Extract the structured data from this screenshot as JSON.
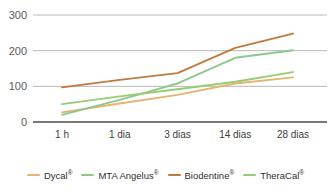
{
  "chart_data": {
    "type": "line",
    "title": "",
    "xlabel": "",
    "ylabel": "",
    "categories": [
      "1 h",
      "1 dia",
      "3 dias",
      "14 dias",
      "28 dias"
    ],
    "ylim": [
      0,
      300
    ],
    "yticks": [
      0,
      100,
      200,
      300
    ],
    "ytick_labels": [
      "0",
      "100",
      "200",
      "300"
    ],
    "grid": true,
    "legend_position": "bottom",
    "series": [
      {
        "name": "Dycal®",
        "base_name": "Dycal",
        "registered": "®",
        "color": "#e8b273",
        "values": [
          27,
          52,
          76,
          108,
          125
        ]
      },
      {
        "name": "MTA Angelus®",
        "base_name": "MTA Angelus",
        "registered": "®",
        "color": "#8cc98a",
        "values": [
          20,
          62,
          108,
          180,
          201
        ]
      },
      {
        "name": "Biodentine®",
        "base_name": "Biodentine",
        "registered": "®",
        "color": "#c07a3e",
        "values": [
          97,
          118,
          137,
          208,
          248
        ]
      },
      {
        "name": "TheraCal®",
        "base_name": "TheraCal",
        "registered": "®",
        "color": "#96cc72",
        "values": [
          50,
          72,
          92,
          113,
          140
        ]
      }
    ]
  },
  "style": {
    "gridline_color": "#b8b8b8",
    "axis_color": "#4a4a4a",
    "ytick_color": "#5a5a5a",
    "xtick_color": "#3d3d3d",
    "background": "#ffffff"
  }
}
